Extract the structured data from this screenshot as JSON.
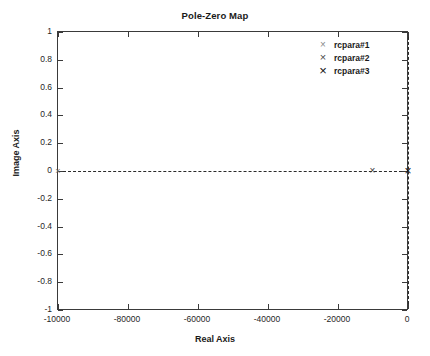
{
  "chart_data": {
    "type": "scatter",
    "title": "Pole-Zero Map",
    "xlabel": "Real Axis",
    "ylabel": "Image Axis",
    "xlim": [
      -10000,
      0
    ],
    "ylim": [
      -1,
      1
    ],
    "grid": false,
    "legend_position": "top-right",
    "x_ticks": [
      {
        "value": -10000,
        "label": "-10000"
      },
      {
        "value": -8000,
        "label": "-80000"
      },
      {
        "value": -6000,
        "label": "-60000"
      },
      {
        "value": -4000,
        "label": "-40000"
      },
      {
        "value": -2000,
        "label": "-20000"
      },
      {
        "value": 0,
        "label": "0"
      }
    ],
    "y_ticks": [
      {
        "value": 1,
        "label": "1"
      },
      {
        "value": 0.8,
        "label": "0.8"
      },
      {
        "value": 0.6,
        "label": "0.6"
      },
      {
        "value": 0.4,
        "label": "0.4"
      },
      {
        "value": 0.2,
        "label": "0.2"
      },
      {
        "value": 0,
        "label": "0"
      },
      {
        "value": -0.2,
        "label": "-0.2"
      },
      {
        "value": -0.4,
        "label": "-0.4"
      },
      {
        "value": -0.6,
        "label": "-0.6"
      },
      {
        "value": -0.8,
        "label": "-0.8"
      },
      {
        "value": -1,
        "label": "-1"
      }
    ],
    "reference_lines": [
      {
        "orientation": "horizontal",
        "value": 0,
        "style": "dashed"
      },
      {
        "orientation": "vertical",
        "value": 0,
        "style": "dashed"
      }
    ],
    "series": [
      {
        "name": "rcpara#1",
        "marker": "x",
        "marker_glyph": "×",
        "marker_size": 9,
        "color": "#707070",
        "points": [
          {
            "x": -10000,
            "y": 0
          }
        ]
      },
      {
        "name": "rcpara#2",
        "marker": "x",
        "marker_glyph": "×",
        "marker_size": 10,
        "color": "#3d3d3d",
        "points": [
          {
            "x": -1020,
            "y": 0
          }
        ]
      },
      {
        "name": "rcpara#3",
        "marker": "x",
        "marker_glyph": "×",
        "marker_size": 12,
        "color": "#111111",
        "points": [
          {
            "x": 0,
            "y": 0
          }
        ]
      }
    ]
  },
  "legend": {
    "entries": [
      {
        "label": "rcpara#1",
        "glyph": "×",
        "size": 10,
        "color": "#8a8a8a"
      },
      {
        "label": "rcpara#2",
        "glyph": "×",
        "size": 11,
        "color": "#4a4a4a"
      },
      {
        "label": "rcpara#3",
        "glyph": "×",
        "size": 13,
        "color": "#111111"
      }
    ]
  }
}
